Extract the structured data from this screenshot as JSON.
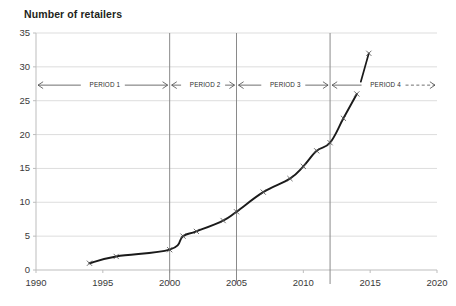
{
  "chart_data": {
    "type": "line",
    "title": "Number of retailers",
    "xlabel": "",
    "ylabel": "Number of retailers",
    "xlim": [
      1990,
      2020
    ],
    "ylim": [
      0,
      35
    ],
    "ytick_labels": [
      "0",
      "5",
      "10",
      "15",
      "20",
      "25",
      "30",
      "35"
    ],
    "yticks": [
      0,
      5,
      10,
      15,
      20,
      25,
      30,
      35
    ],
    "xtick_labels": [
      "1990",
      "1995",
      "2000",
      "2005",
      "2010",
      "2015",
      "2020"
    ],
    "xticks": [
      1990,
      1995,
      2000,
      2005,
      2010,
      2015,
      2020
    ],
    "grid": "horizontal",
    "legend": "none",
    "marker": "x",
    "line_color": "#1a1a1a",
    "grid_color": "#d9d9d9",
    "series": [
      {
        "name": "Number of retailers",
        "x": [
          1994,
          1996,
          2000,
          2001,
          2002,
          2004,
          2005,
          2007,
          2009,
          2010,
          2011,
          2012,
          2013,
          2014
        ],
        "values": [
          1,
          2,
          3,
          5,
          5.7,
          7.3,
          8.6,
          11.5,
          13.5,
          15.3,
          17.6,
          18.8,
          22.4,
          26
        ]
      },
      {
        "name": "Number of retailers (projected segment)",
        "x": [
          2014.3,
          2014.9
        ],
        "values": [
          27.8,
          32
        ]
      }
    ],
    "dividers": [
      2000,
      2005,
      2012
    ],
    "annotations": [
      {
        "label": "PERIOD 1",
        "from": 1990,
        "to": 2000,
        "y": 27.3,
        "arrow_left": "solid",
        "arrow_right": "solid"
      },
      {
        "label": "PERIOD 2",
        "from": 2000,
        "to": 2005,
        "y": 27.3,
        "arrow_left": "solid",
        "arrow_right": "solid"
      },
      {
        "label": "PERIOD 3",
        "from": 2005,
        "to": 2012,
        "y": 27.3,
        "arrow_left": "solid",
        "arrow_right": "solid"
      },
      {
        "label": "PERIOD 4",
        "from": 2012,
        "to": 2020,
        "y": 27.3,
        "arrow_left": "solid",
        "arrow_right": "dashed"
      }
    ]
  }
}
